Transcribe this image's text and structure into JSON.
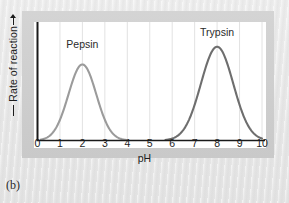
{
  "figure": {
    "caption": "(b)",
    "frame_color": "#cfcfcf",
    "plot_background": "#ffffff",
    "page_background": "#ebebeb"
  },
  "chart_data": {
    "type": "line",
    "title": "",
    "subtitle": "",
    "xlabel": "pH",
    "ylabel": "Rate of reaction",
    "xlim": [
      0,
      10
    ],
    "ylim": [
      0,
      1.08
    ],
    "xticks": [
      "0",
      "1",
      "2",
      "3",
      "4",
      "5",
      "6",
      "7",
      "8",
      "9",
      "10"
    ],
    "yticks": [],
    "grid": "vertical-only",
    "grid_color": "#e2e2e2",
    "axis_color": "#1a1a1a",
    "y_axis_arrow": true,
    "legend": "inline-labels",
    "series": [
      {
        "name": "Pepsin",
        "label": "Pepsin",
        "color": "#9b9b9b",
        "peak_ph": 2.0,
        "peak_value": 0.73,
        "sigma": 0.62,
        "x_start": 0.15,
        "x_end": 4.0,
        "label_x": 2.0,
        "label_y": 0.92,
        "x": [
          0.15,
          0.4,
          0.7,
          1.0,
          1.3,
          1.6,
          1.8,
          2.0,
          2.2,
          2.4,
          2.7,
          3.0,
          3.3,
          3.6,
          3.8,
          4.0
        ],
        "y": [
          0.01,
          0.03,
          0.09,
          0.22,
          0.43,
          0.64,
          0.71,
          0.73,
          0.71,
          0.64,
          0.45,
          0.25,
          0.11,
          0.04,
          0.02,
          0.01
        ]
      },
      {
        "name": "Trypsin",
        "label": "Trypsin",
        "color": "#6e6e6e",
        "peak_ph": 8.0,
        "peak_value": 0.9,
        "sigma": 0.72,
        "x_start": 5.7,
        "x_end": 10.0,
        "label_x": 8.0,
        "label_y": 1.03,
        "x": [
          5.7,
          6.0,
          6.3,
          6.6,
          6.9,
          7.2,
          7.5,
          7.8,
          8.0,
          8.2,
          8.5,
          8.8,
          9.1,
          9.4,
          9.7,
          10.0
        ],
        "y": [
          0.01,
          0.05,
          0.13,
          0.27,
          0.46,
          0.66,
          0.82,
          0.89,
          0.9,
          0.89,
          0.8,
          0.62,
          0.4,
          0.21,
          0.08,
          0.02
        ]
      }
    ]
  }
}
